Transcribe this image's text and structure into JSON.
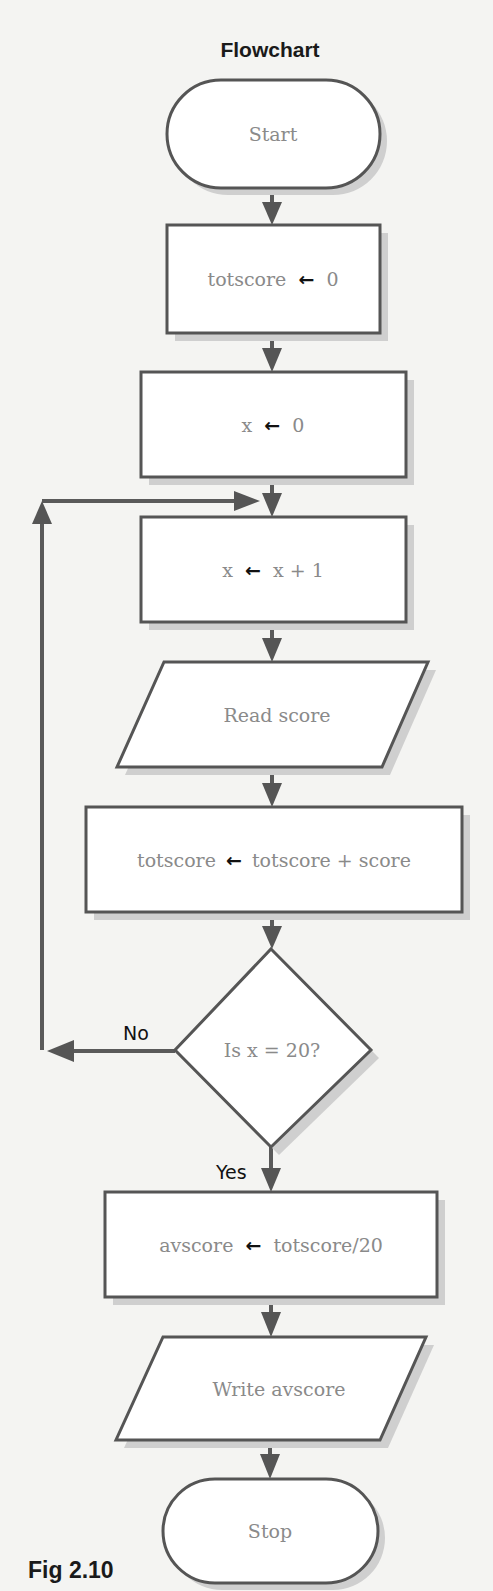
{
  "diagram": {
    "title": "Flowchart",
    "caption": "Fig 2.10",
    "assign_symbol": "←",
    "nodes": {
      "start": {
        "type": "terminal",
        "label": "Start"
      },
      "init_total": {
        "type": "process",
        "lhs": "totscore",
        "rhs": "0"
      },
      "init_x": {
        "type": "process",
        "lhs": "x",
        "rhs": "0"
      },
      "incr_x": {
        "type": "process",
        "lhs": "x",
        "rhs": "x + 1"
      },
      "read": {
        "type": "input",
        "label": "Read score"
      },
      "accum": {
        "type": "process",
        "lhs": "totscore",
        "rhs": "totscore + score"
      },
      "decision": {
        "type": "decision",
        "label": "Is x = 20?"
      },
      "average": {
        "type": "process",
        "lhs": "avscore",
        "rhs": "totscore/20"
      },
      "write": {
        "type": "output",
        "label": "Write avscore"
      },
      "stop": {
        "type": "terminal",
        "label": "Stop"
      }
    },
    "branches": {
      "no": "No",
      "yes": "Yes"
    },
    "edges": [
      {
        "from": "start",
        "to": "init_total"
      },
      {
        "from": "init_total",
        "to": "init_x"
      },
      {
        "from": "init_x",
        "to": "incr_x"
      },
      {
        "from": "incr_x",
        "to": "read"
      },
      {
        "from": "read",
        "to": "accum"
      },
      {
        "from": "accum",
        "to": "decision"
      },
      {
        "from": "decision",
        "to": "incr_x",
        "label": "No"
      },
      {
        "from": "decision",
        "to": "average",
        "label": "Yes"
      },
      {
        "from": "average",
        "to": "write"
      },
      {
        "from": "write",
        "to": "stop"
      }
    ],
    "colors": {
      "background": "#f4f4f2",
      "stroke": "#555555",
      "node_text": "#8a8a8a",
      "label_text": "#111111",
      "shadow": "#cfcfcf"
    }
  }
}
